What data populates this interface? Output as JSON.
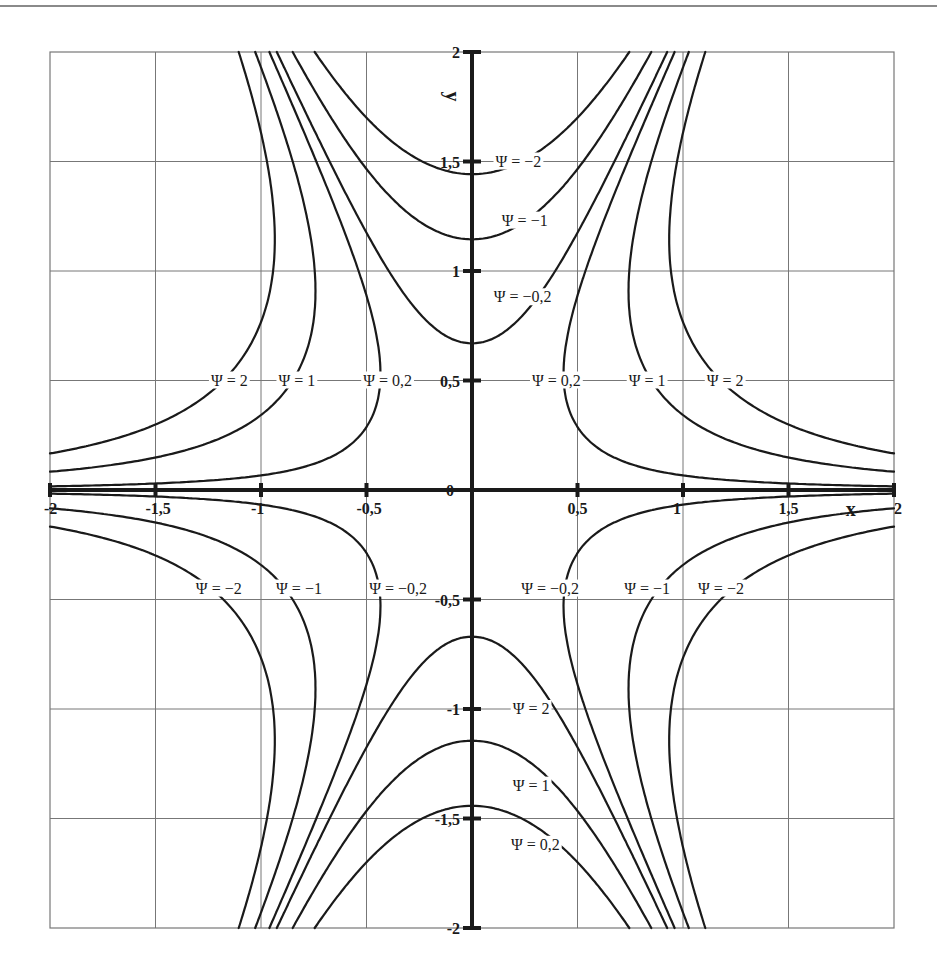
{
  "chart_data": {
    "type": "line",
    "title": "",
    "subtitle": "Streamlines (contour lines) of the stream function Ψ",
    "xlabel": "x",
    "ylabel": "y",
    "xlim": [
      -2,
      2
    ],
    "ylim": [
      -2,
      2
    ],
    "grid": true,
    "grid_step": 0.5,
    "x_ticks": [
      "-2",
      "-1,5",
      "-1",
      "-0,5",
      "0",
      "0,5",
      "1",
      "1,5",
      "2"
    ],
    "y_ticks": [
      "2",
      "1,5",
      "1",
      "0,5",
      "0",
      "-0,5",
      "-1",
      "-1,5",
      "-2"
    ],
    "function_estimate": "Ψ ≈ 3·x²·y − (2/3)·y³",
    "levels": [
      -2,
      -1,
      -0.2,
      0.2,
      1,
      2
    ],
    "series": [
      {
        "name": "Ψ = 2",
        "level": 2,
        "axis_crossings": {
          "y_axis_y": -0.83,
          "line_y_0_5_x": 1.19
        }
      },
      {
        "name": "Ψ = 1",
        "level": 1,
        "axis_crossings": {
          "y_axis_y": -1.14,
          "line_y_0_5_x": 0.85
        }
      },
      {
        "name": "Ψ = 0,2",
        "level": 0.2,
        "axis_crossings": {
          "y_axis_y": -0.67,
          "line_y_0_5_x": 0.43
        }
      },
      {
        "name": "Ψ = -0,2",
        "level": -0.2,
        "axis_crossings": {
          "y_axis_y": 0.67,
          "line_y_-0_5_x": 0.43
        }
      },
      {
        "name": "Ψ = -1",
        "level": -1,
        "axis_crossings": {
          "y_axis_y": 1.14,
          "line_y_-0_5_x": 0.85
        }
      },
      {
        "name": "Ψ = -2",
        "level": -2,
        "axis_crossings": {
          "y_axis_y": 1.44,
          "line_y_-0_5_x": 1.19
        }
      }
    ],
    "annotations": [
      {
        "text": "Ψ = −2",
        "x": 0.22,
        "y": 1.5
      },
      {
        "text": "Ψ = −1",
        "x": 0.25,
        "y": 1.23
      },
      {
        "text": "Ψ = −0,2",
        "x": 0.24,
        "y": 0.88
      },
      {
        "text": "Ψ = 2",
        "x": -1.15,
        "y": 0.5
      },
      {
        "text": "Ψ = 1",
        "x": -0.83,
        "y": 0.5
      },
      {
        "text": "Ψ = 0,2",
        "x": -0.4,
        "y": 0.5
      },
      {
        "text": "Ψ = 0,2",
        "x": 0.4,
        "y": 0.5
      },
      {
        "text": "Ψ = 1",
        "x": 0.83,
        "y": 0.5
      },
      {
        "text": "Ψ = 2",
        "x": 1.2,
        "y": 0.5
      },
      {
        "text": "Ψ = −2",
        "x": -1.2,
        "y": -0.45
      },
      {
        "text": "Ψ = −1",
        "x": -0.82,
        "y": -0.45
      },
      {
        "text": "Ψ = −0,2",
        "x": -0.35,
        "y": -0.45
      },
      {
        "text": "Ψ = −0,2",
        "x": 0.37,
        "y": -0.45
      },
      {
        "text": "Ψ = −1",
        "x": 0.83,
        "y": -0.45
      },
      {
        "text": "Ψ = −2",
        "x": 1.18,
        "y": -0.45
      },
      {
        "text": "Ψ = 2",
        "x": 0.28,
        "y": -1.0
      },
      {
        "text": "Ψ = 1",
        "x": 0.28,
        "y": -1.35
      },
      {
        "text": "Ψ = 0,2",
        "x": 0.3,
        "y": -1.62
      }
    ]
  },
  "axes": {
    "x_label": "x",
    "y_label": "y",
    "origin_label": "0"
  }
}
